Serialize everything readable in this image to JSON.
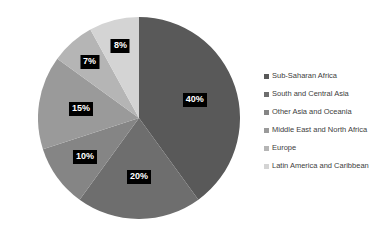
{
  "chart_data": {
    "type": "pie",
    "title": "",
    "xlabel": "",
    "ylabel": "",
    "grid": false,
    "legend_position": "right",
    "start_angle_deg": 0,
    "direction": "clockwise",
    "categories": [
      "Sub-Saharan Africa",
      "South and Central Asia",
      "Other Asia and Oceania",
      "Middle East and North Africa",
      "Europe",
      "Latin America and Caribbean"
    ],
    "values": [
      40,
      20,
      10,
      15,
      7,
      8
    ],
    "data_labels": [
      "40%",
      "20%",
      "10%",
      "15%",
      "7%",
      "8%"
    ],
    "colors": [
      "#595959",
      "#6e6e6e",
      "#858585",
      "#9a9a9a",
      "#b5b5b5",
      "#d4d4d4"
    ],
    "label_text_color": "#ffffff",
    "label_background_color": "#000000",
    "background_color": "#ffffff"
  },
  "legend": {
    "items": [
      {
        "label": "Sub-Saharan Africa",
        "color": "#595959"
      },
      {
        "label": "South and Central Asia",
        "color": "#6e6e6e"
      },
      {
        "label": "Other Asia and Oceania",
        "color": "#858585"
      },
      {
        "label": "Middle East and North Africa",
        "color": "#9a9a9a"
      },
      {
        "label": "Europe",
        "color": "#b5b5b5"
      },
      {
        "label": "Latin America and Caribbean",
        "color": "#d4d4d4"
      }
    ]
  }
}
